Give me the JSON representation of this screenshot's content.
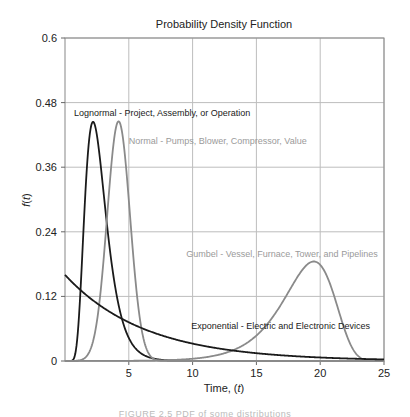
{
  "chart_data": {
    "type": "line",
    "title": "Probability Density Function",
    "xlabel": "Time, (t)",
    "ylabel": "f(t)",
    "xlim": [
      0,
      25
    ],
    "ylim": [
      0,
      0.6
    ],
    "xticks": [
      5,
      10,
      15,
      20,
      25
    ],
    "xtick_labels": [
      "5",
      "10",
      "15",
      "20",
      "25"
    ],
    "yticks": [
      0,
      0.12,
      0.24,
      0.36,
      0.48,
      0.6
    ],
    "ytick_labels": [
      "0",
      "0.12",
      "0.24",
      "0.36",
      "0.48",
      "0.6"
    ],
    "grid": true,
    "legend": "none (inline annotations)",
    "series": [
      {
        "name": "Lognormal - Project, Assembly, or Operation",
        "color": "#1a1a1a",
        "model": {
          "dist": "lognormal",
          "mu": 0.932,
          "sigma": 0.38
        },
        "peak": {
          "t": 2.2,
          "f": 0.44
        },
        "x": [
          0.5,
          1,
          1.5,
          2,
          2.2,
          2.5,
          3,
          3.5,
          4,
          5,
          6,
          7,
          8
        ],
        "values": [
          0.0,
          0.01,
          0.17,
          0.42,
          0.44,
          0.43,
          0.33,
          0.22,
          0.13,
          0.04,
          0.01,
          0.0,
          0.0
        ]
      },
      {
        "name": "Normal - Pumps, Blower, Compressor, Value",
        "color": "#8a8a8a",
        "model": {
          "dist": "normal",
          "mean": 4.2,
          "sd": 0.896
        },
        "peak": {
          "t": 4.2,
          "f": 0.445
        },
        "x": [
          1.5,
          2,
          2.5,
          3,
          3.5,
          4,
          4.2,
          4.5,
          5,
          5.5,
          6,
          6.5,
          7
        ],
        "values": [
          0.005,
          0.022,
          0.073,
          0.18,
          0.33,
          0.43,
          0.445,
          0.42,
          0.3,
          0.16,
          0.06,
          0.017,
          0.003
        ]
      },
      {
        "name": "Gumbel - Vessel, Furnace, Tower, and Pipelines",
        "color": "#8a8a8a",
        "model": {
          "dist": "gumbel-min",
          "mu": 19.5,
          "beta": 1.99
        },
        "peak": {
          "t": 19.5,
          "f": 0.185
        },
        "x": [
          8,
          10,
          12,
          14,
          15,
          16,
          17,
          18,
          19,
          19.5,
          20,
          21,
          22,
          23,
          24,
          25
        ],
        "values": [
          0.0016,
          0.004,
          0.011,
          0.031,
          0.05,
          0.078,
          0.113,
          0.155,
          0.182,
          0.185,
          0.18,
          0.13,
          0.056,
          0.009,
          0.0003,
          0.0
        ]
      },
      {
        "name": "Exponential - Electric and Electronic Devices",
        "color": "#1a1a1a",
        "model": {
          "dist": "exponential",
          "lambda": 0.16
        },
        "x": [
          0,
          2.5,
          5,
          7.5,
          10,
          12.5,
          15,
          17.5,
          20,
          22.5,
          25
        ],
        "values": [
          0.16,
          0.107,
          0.072,
          0.048,
          0.032,
          0.022,
          0.015,
          0.01,
          0.0065,
          0.0044,
          0.003
        ]
      }
    ],
    "annotations": [
      {
        "text": "Lognormal - Project, Assembly, or Operation",
        "t": 0.7,
        "f": 0.455,
        "color": "#1a1a1a"
      },
      {
        "text": "Normal - Pumps, Blower, Compressor, Value",
        "t": 5.0,
        "f": 0.404,
        "color": "#9a9a9a"
      },
      {
        "text": "Gumbel - Vessel, Furnace, Tower, and Pipelines",
        "t": 9.5,
        "f": 0.193,
        "color": "#9a9a9a"
      },
      {
        "text": "Exponential - Electric and Electronic Devices",
        "t": 9.9,
        "f": 0.06,
        "color": "#1a1a1a"
      }
    ]
  },
  "caption": "FIGURE 2.5  PDF of some distributions"
}
